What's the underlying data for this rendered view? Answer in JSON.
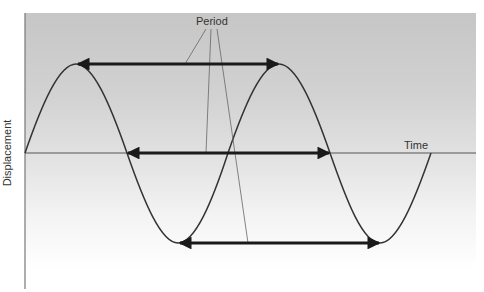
{
  "diagram": {
    "labels": {
      "period": "Period",
      "x_axis": "Time",
      "y_axis": "Displacement"
    },
    "colors": {
      "background_top": "#c6c6c6",
      "background_bottom": "#ffffff",
      "wave": "#333333",
      "arrow": "#1a1a1a",
      "axis": "#555555",
      "callout": "#666666"
    },
    "wave": {
      "cycles": 2,
      "start_phase": "zero-crossing rising",
      "period_px": 203,
      "amplitude_px": 90
    },
    "period_arrows": [
      {
        "name": "peak-to-peak",
        "position": "top"
      },
      {
        "name": "zero-to-zero",
        "position": "middle"
      },
      {
        "name": "trough-to-trough",
        "position": "bottom"
      }
    ]
  }
}
